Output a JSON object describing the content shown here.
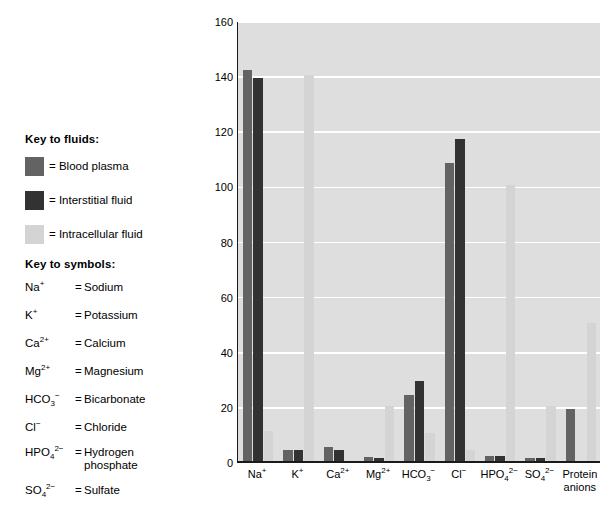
{
  "keys": {
    "fluids_title": "Key to fluids:",
    "symbols_title": "Key to symbols:",
    "fluids": [
      {
        "label": "= Blood plasma",
        "color": "#636363",
        "name": "blood-plasma"
      },
      {
        "label": "= Interstitial fluid",
        "color": "#323232",
        "name": "interstitial-fluid"
      },
      {
        "label": "= Intracellular fluid",
        "color": "#d4d4d4",
        "name": "intracellular-fluid"
      }
    ],
    "symbols": [
      {
        "formula_html": "Na<sup>+</sup>",
        "eq": "=",
        "name": "Sodium"
      },
      {
        "formula_html": "K<sup>+</sup>",
        "eq": "=",
        "name": "Potassium"
      },
      {
        "formula_html": "Ca<sup>2+</sup>",
        "eq": "=",
        "name": "Calcium"
      },
      {
        "formula_html": "Mg<sup>2+</sup>",
        "eq": "=",
        "name": "Magnesium"
      },
      {
        "formula_html": "HCO<sub>3</sub><sup>&#8722;</sup>",
        "eq": "=",
        "name": "Bicarbonate"
      },
      {
        "formula_html": "Cl<sup>&#8722;</sup>",
        "eq": "=",
        "name": "Chloride"
      },
      {
        "formula_html": "HPO<sub>4</sub><sup>2&#8722;</sup>",
        "eq": "=",
        "name": "Hydrogen phosphate"
      },
      {
        "formula_html": "SO<sub>4</sub><sup>2&#8722;</sup>",
        "eq": "=",
        "name": "Sulfate"
      }
    ]
  },
  "chart_data": {
    "type": "bar",
    "title": "",
    "xlabel": "",
    "ylabel": "Total solute concentration (mEq/L)",
    "ylim": [
      0,
      160
    ],
    "yticks": [
      0,
      20,
      40,
      60,
      80,
      100,
      120,
      140,
      160
    ],
    "grid": true,
    "legend_position": "external-left",
    "categories_html": [
      "Na<sup>+</sup>",
      "K<sup>+</sup>",
      "Ca<sup>2+</sup>",
      "Mg<sup>2+</sup>",
      "HCO<sub>3</sub><sup>&#8722;</sup>",
      "Cl<sup>&#8722;</sup>",
      "HPO<sub>4</sub><sup>2&#8722;</sup>",
      "SO<sub>4</sub><sup>2&#8722;</sup>",
      "Protein<br>anions"
    ],
    "categories": [
      "Na+",
      "K+",
      "Ca2+",
      "Mg2+",
      "HCO3-",
      "Cl-",
      "HPO4 2-",
      "SO4 2-",
      "Protein anions"
    ],
    "series": [
      {
        "name": "Blood plasma",
        "color": "#636363",
        "values": [
          142,
          4,
          5,
          1.5,
          24,
          108,
          2,
          1,
          19
        ]
      },
      {
        "name": "Interstitial fluid",
        "color": "#323232",
        "values": [
          139,
          4,
          4,
          1,
          29,
          117,
          2,
          1,
          0
        ]
      },
      {
        "name": "Intracellular fluid",
        "color": "#d4d4d4",
        "values": [
          11,
          140,
          0,
          20,
          10,
          4,
          100,
          20,
          50
        ]
      }
    ],
    "plot_background": "#dedede",
    "gridline_color": "#ffffff",
    "axis_color": "#1a1a1a"
  }
}
